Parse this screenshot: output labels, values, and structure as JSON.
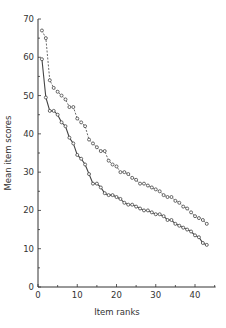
{
  "chart_data": {
    "type": "line",
    "title": "",
    "xlabel": "Item ranks",
    "ylabel": "Mean item scores",
    "xlim": [
      0,
      45
    ],
    "ylim": [
      0,
      70
    ],
    "xticks": [
      0,
      10,
      20,
      30,
      40
    ],
    "yticks": [
      0,
      10,
      20,
      30,
      40,
      50,
      60,
      70
    ],
    "grid": false,
    "legend": null,
    "x": [
      1,
      2,
      3,
      4,
      5,
      6,
      7,
      8,
      9,
      10,
      11,
      12,
      13,
      14,
      15,
      16,
      17,
      18,
      19,
      20,
      21,
      22,
      23,
      24,
      25,
      26,
      27,
      28,
      29,
      30,
      31,
      32,
      33,
      34,
      35,
      36,
      37,
      38,
      39,
      40,
      41,
      42,
      43
    ],
    "series": [
      {
        "name": "upper (dashed)",
        "style": "dashed",
        "marker": "open-circle",
        "values": [
          67,
          65,
          54,
          52,
          51,
          50,
          49,
          47,
          47,
          44,
          43,
          42,
          38.5,
          37.5,
          36.5,
          35.5,
          35.5,
          33,
          32,
          31.5,
          30,
          30,
          29.5,
          28.5,
          28,
          27,
          27,
          26.5,
          26,
          25.5,
          25,
          24,
          23.5,
          23.5,
          22.5,
          22,
          21,
          20.5,
          19.5,
          18.5,
          18,
          17.5,
          16.5
        ]
      },
      {
        "name": "lower (solid)",
        "style": "solid",
        "marker": "open-circle",
        "values": [
          59.5,
          49.5,
          46,
          46,
          45,
          43,
          42,
          39,
          37.5,
          34.5,
          33.5,
          32,
          29.5,
          27,
          27,
          26,
          24.5,
          24,
          24,
          23.5,
          23,
          22,
          21.5,
          21.5,
          21,
          20.5,
          20,
          20,
          19.5,
          19,
          19,
          18.5,
          17.5,
          17.5,
          16.5,
          16,
          15.5,
          15,
          14.5,
          13.5,
          13,
          11.5,
          11
        ]
      }
    ]
  },
  "axes": {
    "x_label": "Item ranks",
    "y_label": "Mean item scores",
    "x_tick_labels": [
      "0",
      "10",
      "20",
      "30",
      "40"
    ],
    "y_tick_labels": [
      "0",
      "10",
      "20",
      "30",
      "40",
      "50",
      "60",
      "70"
    ]
  },
  "style": {
    "line_color": "#444444",
    "marker_fill": "#ffffff",
    "axis_color": "#333333"
  }
}
